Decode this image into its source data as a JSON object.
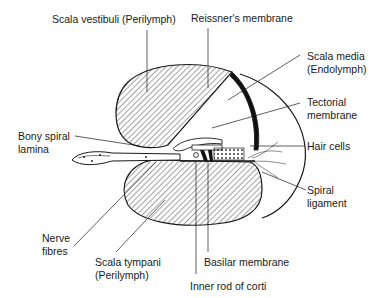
{
  "diagram": {
    "type": "anatomical cross-section",
    "colors": {
      "line": "#1a1a1a",
      "background": "#ffffff",
      "hatch": "#333333"
    },
    "labels": {
      "scala_vestibuli": "Scala vestibuli (Perilymph)",
      "reissners_membrane": "Reissner's membrane",
      "scala_media_1": "Scala media",
      "scala_media_2": "(Endolymph)",
      "tectorial_1": "Tectorial",
      "tectorial_2": "membrane",
      "bony_spiral_1": "Bony spiral",
      "bony_spiral_2": "lamina",
      "hair_cells": "Hair cells",
      "spiral_ligament_1": "Spiral",
      "spiral_ligament_2": "ligament",
      "nerve_fibres_1": "Nerve",
      "nerve_fibres_2": "fibres",
      "scala_tympani_1": "Scala tympani",
      "scala_tympani_2": "(Perilymph)",
      "basilar_membrane": "Basilar membrane",
      "inner_rod": "Inner rod of corti"
    }
  }
}
